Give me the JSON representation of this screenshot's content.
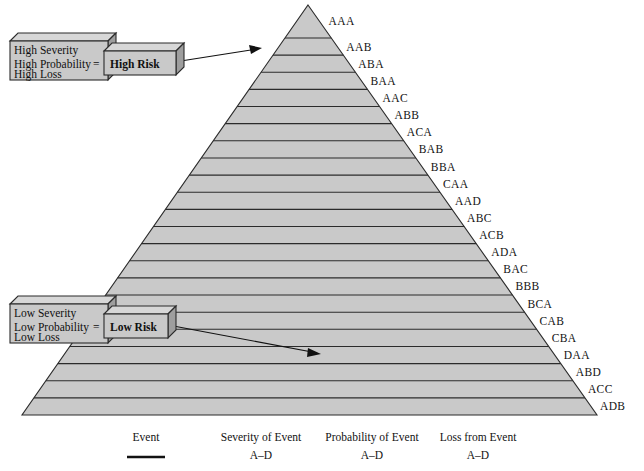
{
  "figure": {
    "background_color": "#ffffff",
    "pyramid_fill_color": "#c9c9c9",
    "outline_color": "#2b2b2b"
  },
  "pyramid": {
    "apex_label": "AAA",
    "band_count": 23,
    "bands": [
      {
        "code": "AAA"
      },
      {
        "code": "AAB"
      },
      {
        "code": "ABA"
      },
      {
        "code": "BAA"
      },
      {
        "code": "AAC"
      },
      {
        "code": "ABB"
      },
      {
        "code": "ACA"
      },
      {
        "code": "BAB"
      },
      {
        "code": "BBA"
      },
      {
        "code": "CAA"
      },
      {
        "code": "AAD"
      },
      {
        "code": "ABC"
      },
      {
        "code": "ACB"
      },
      {
        "code": "ADA"
      },
      {
        "code": "BAC"
      },
      {
        "code": "BBB"
      },
      {
        "code": "BCA"
      },
      {
        "code": "CAB"
      },
      {
        "code": "CBA"
      },
      {
        "code": "DAA"
      },
      {
        "code": "ABD"
      },
      {
        "code": "ACC"
      },
      {
        "code": "ADB"
      }
    ]
  },
  "callouts": {
    "high": {
      "line1": "High Severity",
      "line2": "High Probability",
      "line3": "High Loss",
      "equals": "=",
      "result": "High Risk"
    },
    "low": {
      "line1": "Low Severity",
      "line2": "Low Probability",
      "line3": "Low Loss",
      "equals": "=",
      "result": "Low Risk"
    }
  },
  "legend": {
    "columns": [
      {
        "title": "Event",
        "sub": ""
      },
      {
        "title": "Severity of Event",
        "sub": "A–D"
      },
      {
        "title": "Probability of Event",
        "sub": "A–D"
      },
      {
        "title": "Loss from Event",
        "sub": "A–D"
      }
    ]
  },
  "chart_data": {
    "type": "pyramid",
    "categories": [
      "AAA",
      "AAB",
      "ABA",
      "BAA",
      "AAC",
      "ABB",
      "ACA",
      "BAB",
      "BBA",
      "CAA",
      "AAD",
      "ABC",
      "ACB",
      "ADA",
      "BAC",
      "BBB",
      "BCA",
      "CAB",
      "CBA",
      "DAA",
      "ABD",
      "ACC",
      "ADB"
    ],
    "values": [
      1,
      2,
      3,
      4,
      5,
      6,
      7,
      8,
      9,
      10,
      11,
      12,
      13,
      14,
      15,
      16,
      17,
      18,
      19,
      20,
      21,
      22,
      23
    ],
    "ylabel": "Risk level (apex = high risk, base = low risk)",
    "xlabel": "",
    "grid": false,
    "legend_position": "bottom",
    "annotations": [
      "High Severity / High Probability / High Loss = High Risk (points to apex)",
      "Low Severity / Low Probability / Low Loss = Low Risk (points to base)"
    ],
    "code_scheme": {
      "position_1": "Severity of Event, A–D",
      "position_2": "Probability of Event, A–D",
      "position_3": "Loss from Event, A–D"
    }
  }
}
